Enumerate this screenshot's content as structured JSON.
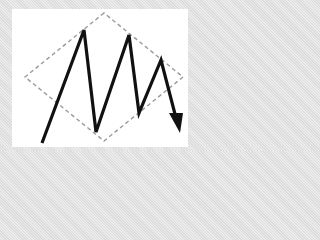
{
  "diagram": {
    "colors": {
      "frame": "#e4e4e4",
      "panel": "#ffffff",
      "diamond_stroke": "#9a9a9a",
      "zigzag_stroke": "#111111"
    },
    "diamond": {
      "points": "104,13 25,77 104,141 183,77",
      "style": "dashed"
    },
    "zigzag": {
      "points": "42,143 84,30 96,132 129,35 139,113 161,60 176,118",
      "arrowhead": "169,113 183,113 180,133"
    }
  }
}
